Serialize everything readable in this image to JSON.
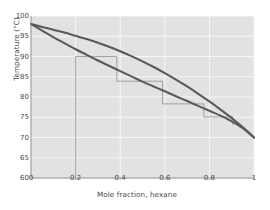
{
  "chart_data": {
    "type": "line",
    "title": "",
    "xlabel": "Mole fraction, hexane",
    "ylabel": "Temperature (°C)",
    "xlim": [
      0,
      1
    ],
    "ylim": [
      60,
      100
    ],
    "xticks": [
      "0",
      "0.2",
      "0.4",
      "0.6",
      "0.8",
      "1"
    ],
    "xtick_values": [
      0,
      0.2,
      0.4,
      0.6,
      0.8,
      1
    ],
    "yticks": [
      "60",
      "65",
      "70",
      "75",
      "80",
      "85",
      "90",
      "95",
      "100"
    ],
    "ytick_values": [
      60,
      65,
      70,
      75,
      80,
      85,
      90,
      95,
      100
    ],
    "grid": true,
    "legend": "none",
    "plot_bg": "#e2e2e2",
    "grid_color": "#f6f6f6",
    "curve_color": "#5a5a5a",
    "construction_color": "#9a9a9a",
    "axis_color": "#8c8c8c",
    "text_color": "#4a4a4a",
    "series": [
      {
        "name": "bubble-point-curve",
        "role": "liquid",
        "x": [
          0,
          0.05,
          0.1,
          0.15,
          0.2,
          0.25,
          0.3,
          0.35,
          0.4,
          0.45,
          0.5,
          0.55,
          0.6,
          0.65,
          0.7,
          0.75,
          0.8,
          0.85,
          0.9,
          0.95,
          1
        ],
        "y": [
          98.0,
          96.4,
          94.8,
          93.3,
          91.8,
          90.4,
          89.0,
          87.7,
          86.4,
          85.1,
          83.8,
          82.6,
          81.4,
          80.2,
          79.0,
          77.8,
          76.6,
          75.4,
          74.0,
          72.3,
          70.0
        ]
      },
      {
        "name": "dew-point-curve",
        "role": "vapor",
        "x": [
          0,
          0.05,
          0.1,
          0.15,
          0.2,
          0.25,
          0.3,
          0.35,
          0.4,
          0.45,
          0.5,
          0.55,
          0.6,
          0.65,
          0.7,
          0.75,
          0.8,
          0.85,
          0.9,
          0.95,
          1
        ],
        "y": [
          98.0,
          97.3,
          96.6,
          95.9,
          95.1,
          94.3,
          93.4,
          92.4,
          91.3,
          90.1,
          88.8,
          87.4,
          85.9,
          84.3,
          82.6,
          80.8,
          78.9,
          76.9,
          74.8,
          72.5,
          70.0
        ]
      }
    ],
    "construction": {
      "feed_line": {
        "x": 0.2,
        "y_bottom": 60,
        "y_top": 90.0
      },
      "steps": [
        {
          "h_from_x": 0.2,
          "h_to_x": 0.385,
          "y": 90.0,
          "v_x": 0.385,
          "v_from_y": 90.0,
          "v_to_y": 83.9
        },
        {
          "h_from_x": 0.385,
          "h_to_x": 0.59,
          "y": 83.9,
          "v_x": 0.59,
          "v_from_y": 83.9,
          "v_to_y": 78.3
        },
        {
          "h_from_x": 0.59,
          "h_to_x": 0.775,
          "y": 78.3,
          "v_x": 0.775,
          "v_from_y": 78.3,
          "v_to_y": 75.1
        },
        {
          "h_from_x": 0.775,
          "h_to_x": 0.905,
          "y": 75.1,
          "v_x": 0.905,
          "v_from_y": 75.1,
          "v_to_y": 73.0
        }
      ]
    }
  }
}
